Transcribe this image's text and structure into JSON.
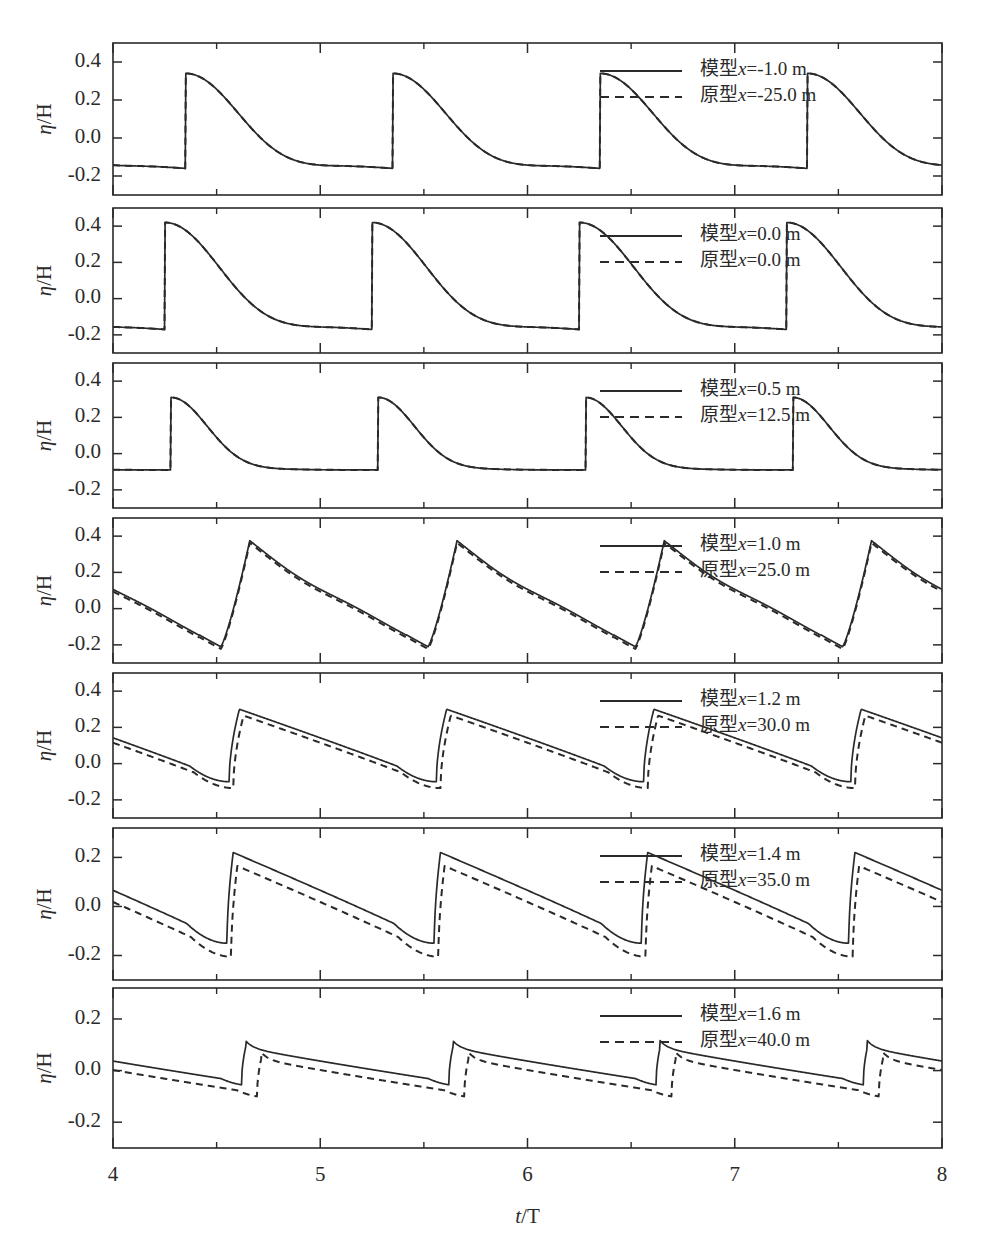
{
  "figure": {
    "xlabel": "t/T",
    "ylabel": "η/H",
    "x_ticks": [
      "4",
      "5",
      "6",
      "7",
      "8"
    ],
    "x_tick_values": [
      4,
      5,
      6,
      7,
      8
    ],
    "x_minor_values": [
      4.5,
      5.5,
      6.5,
      7.5
    ],
    "xlim": [
      4,
      8
    ],
    "background": "#ffffff",
    "line_color": "#2a2a2a"
  },
  "chart_data": {
    "type": "line",
    "title": "",
    "xlabel": "t/T",
    "ylabel": "η/H",
    "xlim": [
      4,
      8
    ],
    "grid": false,
    "legend_position": "upper-right inside each panel",
    "panels": [
      {
        "index": 1,
        "ylim": [
          -0.3,
          0.5
        ],
        "y_ticks": [
          0.4,
          0.2,
          0.0,
          -0.2
        ],
        "y_tick_labels": [
          "0.4",
          "0.2",
          "0.0",
          "-0.2"
        ],
        "legend": [
          {
            "label": "模型x=-1.0 m",
            "style": "solid"
          },
          {
            "label": "原型x=-25.0 m",
            "style": "dashed"
          }
        ],
        "waveform": {
          "kind": "cnoidal-peaked",
          "peak": 0.34,
          "trough": -0.16,
          "peak_phase": 0.35,
          "period": 1.0,
          "dashed_offset": 0.0,
          "sharpness": 3.2
        },
        "series": [
          {
            "name": "模型x=-1.0 m",
            "style": "solid",
            "peaks_t": [
              4.35,
              5.35,
              6.35,
              7.35
            ],
            "peaks_y": [
              0.34,
              0.34,
              0.34,
              0.34
            ],
            "troughs_t": [
              4.9,
              5.9,
              6.9,
              7.9
            ],
            "troughs_y": [
              -0.16,
              -0.16,
              -0.16,
              -0.16
            ]
          },
          {
            "name": "原型x=-25.0 m",
            "style": "dashed",
            "peaks_t": [
              4.35,
              5.35,
              6.35,
              7.35
            ],
            "peaks_y": [
              0.34,
              0.34,
              0.34,
              0.34
            ],
            "troughs_t": [
              4.9,
              5.9,
              6.9,
              7.9
            ],
            "troughs_y": [
              -0.17,
              -0.17,
              -0.17,
              -0.17
            ]
          }
        ]
      },
      {
        "index": 2,
        "ylim": [
          -0.3,
          0.5
        ],
        "y_ticks": [
          0.4,
          0.2,
          0.0,
          -0.2
        ],
        "y_tick_labels": [
          "0.4",
          "0.2",
          "0.0",
          "-0.2"
        ],
        "legend": [
          {
            "label": "模型x=0.0 m",
            "style": "solid"
          },
          {
            "label": "原型x=0.0 m",
            "style": "dashed"
          }
        ],
        "waveform": {
          "kind": "cnoidal-peaked",
          "peak": 0.42,
          "trough": -0.17,
          "peak_phase": 0.25,
          "period": 1.0,
          "dashed_offset": 0.0,
          "sharpness": 3.0
        },
        "series": [
          {
            "name": "模型x=0.0 m",
            "style": "solid",
            "peaks_t": [
              4.25,
              5.25,
              6.25,
              7.25
            ],
            "peaks_y": [
              0.42,
              0.42,
              0.42,
              0.42
            ],
            "troughs_t": [
              4.8,
              5.8,
              6.8,
              7.8
            ],
            "troughs_y": [
              -0.17,
              -0.17,
              -0.17,
              -0.17
            ]
          },
          {
            "name": "原型x=0.0 m",
            "style": "dashed",
            "peaks_t": [
              4.25,
              5.25,
              6.25,
              7.25
            ],
            "peaks_y": [
              0.42,
              0.42,
              0.42,
              0.42
            ],
            "troughs_t": [
              4.8,
              5.8,
              6.8,
              7.8
            ],
            "troughs_y": [
              -0.175,
              -0.175,
              -0.175,
              -0.175
            ]
          }
        ]
      },
      {
        "index": 3,
        "ylim": [
          -0.3,
          0.5
        ],
        "y_ticks": [
          0.4,
          0.2,
          0.0,
          -0.2
        ],
        "y_tick_labels": [
          "0.4",
          "0.2",
          "0.0",
          "-0.2"
        ],
        "legend": [
          {
            "label": "模型x=0.5 m",
            "style": "solid"
          },
          {
            "label": "原型x=12.5 m",
            "style": "dashed"
          }
        ],
        "waveform": {
          "kind": "cnoidal-narrow",
          "peak": 0.31,
          "trough": -0.09,
          "peak_phase": 0.28,
          "period": 1.0,
          "dashed_offset": 0.0,
          "sharpness": 7.0
        },
        "series": [
          {
            "name": "模型x=0.5 m",
            "style": "solid",
            "peaks_t": [
              4.28,
              5.28,
              6.28,
              7.28
            ],
            "peaks_y": [
              0.31,
              0.31,
              0.3,
              0.31
            ],
            "troughs_t": [
              4.85,
              5.85,
              6.85,
              7.85
            ],
            "troughs_y": [
              -0.09,
              -0.09,
              -0.09,
              -0.09
            ]
          },
          {
            "name": "原型x=12.5 m",
            "style": "dashed",
            "peaks_t": [
              4.28,
              5.28,
              6.28,
              7.28
            ],
            "peaks_y": [
              0.31,
              0.31,
              0.3,
              0.31
            ],
            "troughs_t": [
              4.85,
              5.85,
              6.85,
              7.85
            ],
            "troughs_y": [
              -0.095,
              -0.095,
              -0.095,
              -0.095
            ]
          }
        ]
      },
      {
        "index": 4,
        "ylim": [
          -0.3,
          0.5
        ],
        "y_ticks": [
          0.4,
          0.2,
          0.0,
          -0.2
        ],
        "y_tick_labels": [
          "0.4",
          "0.2",
          "0.0",
          "-0.2"
        ],
        "legend": [
          {
            "label": "模型x=1.0 m",
            "style": "solid"
          },
          {
            "label": "原型x=25.0 m",
            "style": "dashed"
          }
        ],
        "waveform": {
          "kind": "sawtooth-asym",
          "peak": 0.37,
          "trough": -0.21,
          "peak_phase": 0.52,
          "period": 1.0,
          "dashed_offset": -0.012,
          "sharpness": 0.14
        },
        "series": [
          {
            "name": "模型x=1.0 m",
            "style": "solid",
            "peaks_t": [
              4.52,
              5.52,
              6.52,
              7.52
            ],
            "peaks_y": [
              0.37,
              0.36,
              0.37,
              0.37
            ],
            "troughs_t": [
              4.3,
              5.3,
              6.3,
              7.3
            ],
            "troughs_y": [
              -0.21,
              -0.21,
              -0.21,
              -0.21
            ]
          },
          {
            "name": "原型x=25.0 m",
            "style": "dashed",
            "peaks_t": [
              4.52,
              5.52,
              6.52,
              7.52
            ],
            "peaks_y": [
              0.37,
              0.36,
              0.37,
              0.37
            ],
            "troughs_t": [
              4.3,
              5.3,
              6.3,
              7.3
            ],
            "troughs_y": [
              -0.22,
              -0.22,
              -0.22,
              -0.22
            ]
          }
        ]
      },
      {
        "index": 5,
        "ylim": [
          -0.3,
          0.5
        ],
        "y_ticks": [
          0.4,
          0.2,
          0.0,
          -0.2
        ],
        "y_tick_labels": [
          "0.4",
          "0.2",
          "0.0",
          "-0.2"
        ],
        "legend": [
          {
            "label": "模型x=1.2 m",
            "style": "solid"
          },
          {
            "label": "原型x=30.0 m",
            "style": "dashed"
          }
        ],
        "waveform": {
          "kind": "bore-front",
          "peak": 0.3,
          "trough": -0.1,
          "peak_phase": 0.56,
          "period": 1.0,
          "dashed_offset": -0.035,
          "sharpness": 0.05
        },
        "series": [
          {
            "name": "模型x=1.2 m",
            "style": "solid",
            "peaks_t": [
              4.56,
              5.56,
              6.56,
              7.56
            ],
            "peaks_y": [
              0.3,
              0.3,
              0.29,
              0.3
            ],
            "troughs_t": [
              4.45,
              5.45,
              6.45,
              7.45
            ],
            "troughs_y": [
              -0.1,
              -0.1,
              -0.1,
              -0.1
            ]
          },
          {
            "name": "原型x=30.0 m",
            "style": "dashed",
            "peaks_t": [
              4.56,
              5.56,
              6.56,
              7.56
            ],
            "peaks_y": [
              0.3,
              0.3,
              0.29,
              0.3
            ],
            "troughs_t": [
              4.45,
              5.45,
              6.45,
              7.45
            ],
            "troughs_y": [
              -0.14,
              -0.14,
              -0.14,
              -0.14
            ]
          }
        ]
      },
      {
        "index": 6,
        "ylim": [
          -0.3,
          0.32
        ],
        "y_ticks": [
          0.2,
          0.0,
          -0.2
        ],
        "y_tick_labels": [
          "0.2",
          "0.0",
          "-0.2"
        ],
        "legend": [
          {
            "label": "模型x=1.4 m",
            "style": "solid"
          },
          {
            "label": "原型x=35.0 m",
            "style": "dashed"
          }
        ],
        "waveform": {
          "kind": "bore-front",
          "peak": 0.22,
          "trough": -0.15,
          "peak_phase": 0.55,
          "period": 1.0,
          "dashed_offset": -0.055,
          "sharpness": 0.03
        },
        "series": [
          {
            "name": "模型x=1.4 m",
            "style": "solid",
            "peaks_t": [
              4.55,
              5.55,
              6.55,
              7.55
            ],
            "peaks_y": [
              0.22,
              0.22,
              0.21,
              0.22
            ],
            "troughs_t": [
              4.5,
              5.5,
              6.5,
              7.5
            ],
            "troughs_y": [
              -0.15,
              -0.16,
              -0.15,
              -0.15
            ]
          },
          {
            "name": "原型x=35.0 m",
            "style": "dashed",
            "peaks_t": [
              4.58,
              5.58,
              6.58,
              7.58
            ],
            "peaks_y": [
              0.22,
              0.22,
              0.21,
              0.22
            ],
            "troughs_t": [
              4.55,
              5.55,
              6.55,
              7.55
            ],
            "troughs_y": [
              -0.21,
              -0.21,
              -0.21,
              -0.21
            ]
          }
        ]
      },
      {
        "index": 7,
        "ylim": [
          -0.3,
          0.32
        ],
        "y_ticks": [
          0.2,
          0.0,
          -0.2
        ],
        "y_tick_labels": [
          "0.2",
          "0.0",
          "-0.2"
        ],
        "legend": [
          {
            "label": "模型x=1.6 m",
            "style": "solid"
          },
          {
            "label": "原型x=40.0 m",
            "style": "dashed"
          }
        ],
        "waveform": {
          "kind": "bore-small",
          "peak": 0.09,
          "trough": -0.055,
          "peak_phase": 0.62,
          "period": 1.0,
          "dashed_offset": -0.045,
          "sharpness": 0.02
        },
        "series": [
          {
            "name": "模型x=1.6 m",
            "style": "solid",
            "peaks_t": [
              4.62,
              5.62,
              6.62,
              7.62
            ],
            "peaks_y": [
              0.09,
              0.095,
              0.09,
              0.09
            ],
            "troughs_t": [
              4.6,
              5.6,
              6.6,
              7.6
            ],
            "troughs_y": [
              -0.055,
              -0.055,
              -0.055,
              -0.06
            ]
          },
          {
            "name": "原型x=40.0 m",
            "style": "dashed",
            "peaks_t": [
              4.7,
              5.7,
              6.7,
              7.7
            ],
            "peaks_y": [
              0.045,
              0.05,
              0.045,
              0.045
            ],
            "troughs_t": [
              4.68,
              5.68,
              6.68,
              7.68
            ],
            "troughs_y": [
              -0.1,
              -0.1,
              -0.105,
              -0.105
            ]
          }
        ]
      }
    ]
  }
}
